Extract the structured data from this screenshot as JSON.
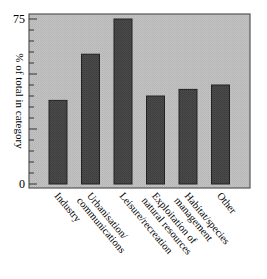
{
  "chart_data": {
    "type": "bar",
    "title": "",
    "xlabel": "",
    "ylabel": "% of total in category",
    "ylim": [
      0,
      75
    ],
    "yticks_labeled": [
      0,
      75
    ],
    "minor_tick_step": 5,
    "grid": false,
    "legend": null,
    "categories": [
      "Industry",
      "Urbanisation/ communications",
      "Leisure/recreation",
      "Exploitation of natural resources",
      "Habitat/species management",
      "Other"
    ],
    "category_lines": [
      [
        "Industry"
      ],
      [
        "Urbanisation/",
        "communications"
      ],
      [
        "Leisure/recreation"
      ],
      [
        "Exploitation of",
        "natural resources"
      ],
      [
        "Habitat/species",
        "management"
      ],
      [
        "Other"
      ]
    ],
    "values": [
      38,
      59,
      75,
      40,
      43,
      45
    ],
    "colors": {
      "plot_background": "#bdbdbd",
      "bar_fill": "#4a4a4a",
      "bar_edge": "#222222",
      "axis": "#333333"
    }
  }
}
